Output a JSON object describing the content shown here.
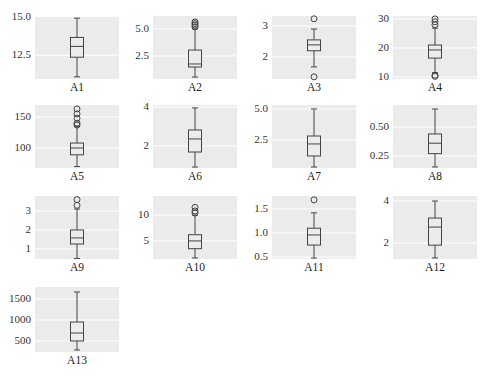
{
  "chart_data": {
    "type": "box",
    "layout": {
      "rows": 4,
      "cols": 4,
      "grid": true,
      "background": "#ebebeb",
      "gridline_color": "#ffffff",
      "line_color": "#444444"
    },
    "subplots": [
      {
        "label": "A1",
        "ylim": [
          10.96,
          15.04
        ],
        "yticks": [
          12.5,
          15.0
        ],
        "ytick_labels": [
          "12.5",
          "15.0"
        ],
        "whisker_low": 11.1,
        "q1": 12.37,
        "median": 13.07,
        "q3": 13.65,
        "whisker_high": 14.9,
        "outliers": []
      },
      {
        "label": "A2",
        "ylim": [
          0.37,
          6.2
        ],
        "yticks": [
          2.5,
          5.0
        ],
        "ytick_labels": [
          "2.5",
          "5.0"
        ],
        "whisker_low": 0.55,
        "q1": 1.48,
        "median": 1.76,
        "q3": 3.05,
        "whisker_high": 5.0,
        "outliers": [
          5.2,
          5.35,
          5.5,
          5.65
        ]
      },
      {
        "label": "A3",
        "ylim": [
          1.29,
          3.32
        ],
        "yticks": [
          2,
          3
        ],
        "ytick_labels": [
          "2",
          "3"
        ],
        "whisker_low": 1.68,
        "q1": 2.2,
        "median": 2.39,
        "q3": 2.55,
        "whisker_high": 2.9,
        "outliers": [
          1.36,
          3.23
        ]
      },
      {
        "label": "A4",
        "ylim": [
          9.3,
          31.0
        ],
        "yticks": [
          10,
          20,
          30
        ],
        "ytick_labels": [
          "10",
          "20",
          "30"
        ],
        "whisker_low": 11.5,
        "q1": 16.5,
        "median": 19.3,
        "q3": 21.0,
        "whisker_high": 26.8,
        "outliers": [
          10.2,
          10.6,
          28.0,
          29.0,
          30.0
        ]
      },
      {
        "label": "A5",
        "ylim": [
          67.7,
          169.4
        ],
        "yticks": [
          100,
          150
        ],
        "ytick_labels": [
          "100",
          "150"
        ],
        "whisker_low": 70,
        "q1": 89,
        "median": 100,
        "q3": 108,
        "whisker_high": 135,
        "outliers": [
          137,
          140,
          148,
          155,
          163
        ]
      },
      {
        "label": "A6",
        "ylim": [
          0.87,
          4.1
        ],
        "yticks": [
          2,
          4
        ],
        "ytick_labels": [
          "2",
          "4"
        ],
        "whisker_low": 0.92,
        "q1": 1.69,
        "median": 2.36,
        "q3": 2.82,
        "whisker_high": 3.95,
        "outliers": []
      },
      {
        "label": "A7",
        "ylim": [
          0.24,
          5.32
        ],
        "yticks": [
          2.5,
          5.0
        ],
        "ytick_labels": [
          "2.5",
          "5.0"
        ],
        "whisker_low": 0.32,
        "q1": 1.21,
        "median": 2.18,
        "q3": 2.82,
        "whisker_high": 5.0,
        "outliers": []
      },
      {
        "label": "A8",
        "ylim": [
          0.146,
          0.69
        ],
        "yticks": [
          0.25,
          0.5
        ],
        "ytick_labels": [
          "0.25",
          "0.50"
        ],
        "whisker_low": 0.155,
        "q1": 0.27,
        "median": 0.36,
        "q3": 0.44,
        "whisker_high": 0.655,
        "outliers": []
      },
      {
        "label": "A9",
        "ylim": [
          0.47,
          3.79
        ],
        "yticks": [
          1,
          2,
          3
        ],
        "ytick_labels": [
          "1",
          "2",
          "3"
        ],
        "whisker_low": 0.5,
        "q1": 1.26,
        "median": 1.58,
        "q3": 2.0,
        "whisker_high": 3.1,
        "outliers": [
          3.3,
          3.6
        ]
      },
      {
        "label": "A10",
        "ylim": [
          1.5,
          13.7
        ],
        "yticks": [
          5,
          10
        ],
        "ytick_labels": [
          "5",
          "10"
        ],
        "whisker_low": 1.7,
        "q1": 3.5,
        "median": 5.0,
        "q3": 6.2,
        "whisker_high": 10.0,
        "outliers": [
          10.4,
          10.8,
          11.5
        ]
      },
      {
        "label": "A11",
        "ylim": [
          0.46,
          1.77
        ],
        "yticks": [
          0.5,
          1.0,
          1.5
        ],
        "ytick_labels": [
          "0.5",
          "1.0",
          "1.5"
        ],
        "whisker_low": 0.48,
        "q1": 0.75,
        "median": 0.96,
        "q3": 1.1,
        "whisker_high": 1.42,
        "outliers": [
          1.69
        ]
      },
      {
        "label": "A12",
        "ylim": [
          1.24,
          4.24
        ],
        "yticks": [
          2,
          4
        ],
        "ytick_labels": [
          "2",
          "4"
        ],
        "whisker_low": 1.29,
        "q1": 1.9,
        "median": 2.76,
        "q3": 3.19,
        "whisker_high": 4.0,
        "outliers": []
      },
      {
        "label": "A13",
        "ylim": [
          238,
          1786
        ],
        "yticks": [
          500,
          1000,
          1500
        ],
        "ytick_labels": [
          "500",
          "1000",
          "1500"
        ],
        "whisker_low": 286,
        "q1": 500,
        "median": 690,
        "q3": 952,
        "whisker_high": 1667,
        "outliers": []
      }
    ]
  }
}
